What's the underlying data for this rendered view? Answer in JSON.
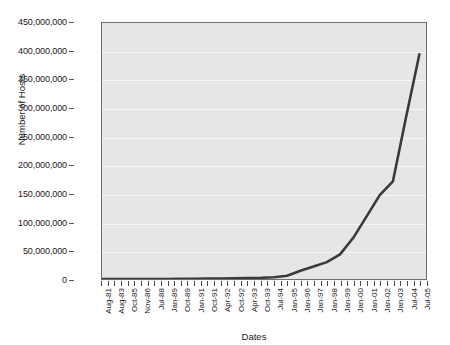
{
  "chart_data": {
    "type": "line",
    "title": "",
    "xlabel": "Dates",
    "ylabel": "Number of Hosts",
    "ylim": [
      0,
      450000000
    ],
    "ytick_labels": [
      "0",
      "50,000,000",
      "100,000,000",
      "150,000,000",
      "200,000,000",
      "250,000,000",
      "300,000,000",
      "350,000,000",
      "400,000,000",
      "450,000,000"
    ],
    "ytick_values": [
      0,
      50000000,
      100000000,
      150000000,
      200000000,
      250000000,
      300000000,
      350000000,
      400000000,
      450000000
    ],
    "grid": "horizontal",
    "legend": "none",
    "categories": [
      "Aug-81",
      "Aug-83",
      "Oct-85",
      "Nov-86",
      "Jul-88",
      "Jan-89",
      "Oct-89",
      "Jan-91",
      "Oct-91",
      "Apr-92",
      "Oct-92",
      "Apr-93",
      "Oct-93",
      "Jul-94",
      "Jan-95",
      "Jan-96",
      "Jan-97",
      "Jan-98",
      "Jan-99",
      "Jan-00",
      "Jan-01",
      "Jan-02",
      "Jan-03",
      "Jul-04",
      "Jul-05"
    ],
    "values": [
      213,
      562,
      2308,
      5089,
      33000,
      80000,
      159000,
      376000,
      617000,
      890000,
      1136000,
      1486000,
      2056000,
      3212000,
      5846000,
      14352000,
      21819000,
      29670000,
      43230000,
      72398000,
      109574000,
      147345000,
      171638000,
      285139000,
      395000000
    ],
    "line_color": "#3a3a3a",
    "line_width": 2.6,
    "plot_background": "#e6e6e6",
    "gridline_color": "#f7f7f7",
    "axis_color": "#6e6e6e"
  }
}
